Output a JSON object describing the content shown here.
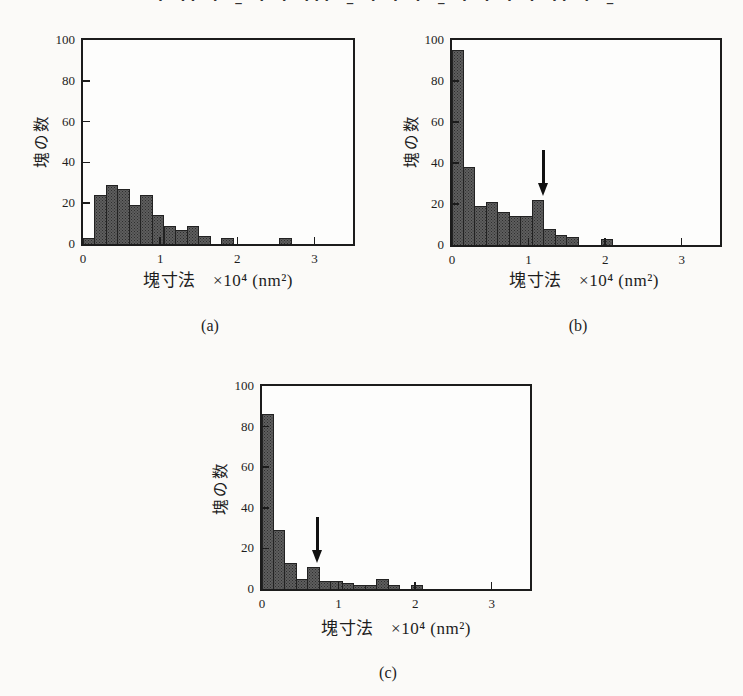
{
  "top_clipped_text_marks": ". .. . _ . . ... _ . . . _ . . . . .. . _ . . ... ..",
  "colors": {
    "background": "#fbfaf8",
    "axis": "#1c1c1c",
    "text": "#1d1d1d",
    "bar_fill": "#5e5e5e",
    "bar_dot": "#2e2e2e",
    "bar_border": "#222222",
    "arrow": "#111111"
  },
  "figure": {
    "y_axis_label": "塊の数",
    "x_axis_label": "塊寸法　×10⁴ (nm²)",
    "panel_labels": [
      "(a)",
      "(b)",
      "(c)"
    ]
  },
  "chart_data": [
    {
      "type": "bar",
      "subtype": "histogram",
      "panel": "(a)",
      "xlabel": "塊寸法　×10⁴ (nm²)",
      "ylabel": "塊の数",
      "x_unit": "×10⁴ nm²",
      "bin_start": 0,
      "bin_width": 0.15,
      "xlim": [
        0,
        3.5
      ],
      "ylim": [
        0,
        100
      ],
      "x_ticks": [
        0,
        1,
        2,
        3
      ],
      "y_ticks": [
        0,
        20,
        40,
        60,
        80,
        100
      ],
      "grid": false,
      "values": [
        3,
        24,
        29,
        27,
        19,
        24,
        14,
        9,
        7,
        9,
        4,
        0,
        3,
        0,
        0,
        0,
        0,
        3
      ],
      "arrow": null
    },
    {
      "type": "bar",
      "subtype": "histogram",
      "panel": "(b)",
      "xlabel": "塊寸法　×10⁴ (nm²)",
      "ylabel": "塊の数",
      "x_unit": "×10⁴ nm²",
      "bin_start": 0,
      "bin_width": 0.15,
      "xlim": [
        0,
        3.5
      ],
      "ylim": [
        0,
        100
      ],
      "x_ticks": [
        0,
        1,
        2,
        3
      ],
      "y_ticks": [
        0,
        20,
        40,
        60,
        80,
        100
      ],
      "grid": false,
      "values": [
        95,
        38,
        19,
        21,
        16,
        14,
        14,
        22,
        8,
        5,
        4,
        0,
        0,
        3
      ],
      "arrow": {
        "x": 1.2,
        "target_bin_index": 7
      }
    },
    {
      "type": "bar",
      "subtype": "histogram",
      "panel": "(c)",
      "xlabel": "塊寸法　×10⁴ (nm²)",
      "ylabel": "塊の数",
      "x_unit": "×10⁴ nm²",
      "bin_start": 0,
      "bin_width": 0.15,
      "xlim": [
        0,
        3.5
      ],
      "ylim": [
        0,
        100
      ],
      "x_ticks": [
        0,
        1,
        2,
        3
      ],
      "y_ticks": [
        0,
        20,
        40,
        60,
        80,
        100
      ],
      "grid": false,
      "values": [
        86,
        29,
        13,
        5,
        11,
        4,
        4,
        3,
        2,
        2,
        5,
        2,
        0,
        2
      ],
      "arrow": {
        "x": 0.73,
        "target_bin_index": 4
      }
    }
  ]
}
